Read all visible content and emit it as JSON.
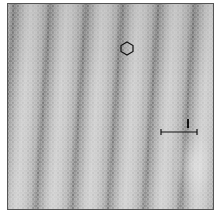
{
  "image": {
    "type": "STM topograph",
    "description": "Grayscale atomic-resolution scan with diagonal dark stripes (moire modulation) over a hexagonal atomic lattice",
    "colors": {
      "frame": "#555555",
      "dark_stripe": "#2e2e2e",
      "light": "#b8b8b8",
      "overlay_lines": "#111111"
    }
  },
  "annotations": {
    "hexagon": {
      "icon": "hexagon-outline-icon"
    },
    "scale_bar": {
      "label": "l"
    }
  }
}
